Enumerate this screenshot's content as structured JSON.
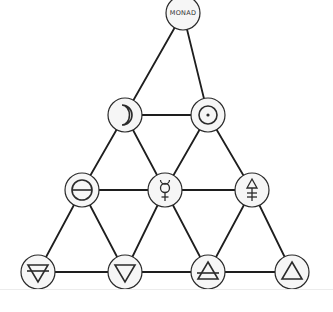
{
  "diagram": {
    "colors": {
      "background": "#ffffff",
      "edge": "#1e1e1e",
      "node_fill": "#f6f6f6",
      "node_stroke": "#2a2a2a",
      "symbol": "#2b2b2b",
      "separator": "#ececec"
    },
    "node_radius": 17,
    "rows": [
      {
        "row": 1,
        "nodes": [
          {
            "id": "monad",
            "label": "MONAD",
            "symbol": "monad-text",
            "x": 183,
            "y": 13
          }
        ]
      },
      {
        "row": 2,
        "nodes": [
          {
            "id": "moon",
            "label": "☽",
            "symbol": "moon-icon",
            "x": 125,
            "y": 115
          },
          {
            "id": "sun",
            "label": "☉",
            "symbol": "sun-icon",
            "x": 208,
            "y": 115
          }
        ]
      },
      {
        "row": 3,
        "nodes": [
          {
            "id": "salt",
            "label": "⊖",
            "symbol": "salt-icon",
            "x": 82,
            "y": 190
          },
          {
            "id": "mercury",
            "label": "☿",
            "symbol": "mercury-icon",
            "x": 165,
            "y": 190
          },
          {
            "id": "sulfur",
            "label": "🜍",
            "symbol": "sulfur-icon",
            "x": 252,
            "y": 190
          }
        ]
      },
      {
        "row": 4,
        "nodes": [
          {
            "id": "earth",
            "label": "🜃",
            "symbol": "earth-icon",
            "x": 38,
            "y": 272
          },
          {
            "id": "water",
            "label": "🜄",
            "symbol": "water-icon",
            "x": 125,
            "y": 272
          },
          {
            "id": "air",
            "label": "🜁",
            "symbol": "air-icon",
            "x": 208,
            "y": 272
          },
          {
            "id": "fire",
            "label": "🜂",
            "symbol": "fire-icon",
            "x": 292,
            "y": 272
          }
        ]
      }
    ],
    "edges": [
      [
        "monad",
        "moon"
      ],
      [
        "monad",
        "sun"
      ],
      [
        "moon",
        "sun"
      ],
      [
        "moon",
        "salt"
      ],
      [
        "moon",
        "mercury"
      ],
      [
        "sun",
        "mercury"
      ],
      [
        "sun",
        "sulfur"
      ],
      [
        "salt",
        "mercury"
      ],
      [
        "mercury",
        "sulfur"
      ],
      [
        "salt",
        "earth"
      ],
      [
        "salt",
        "water"
      ],
      [
        "mercury",
        "water"
      ],
      [
        "mercury",
        "air"
      ],
      [
        "sulfur",
        "air"
      ],
      [
        "sulfur",
        "fire"
      ],
      [
        "earth",
        "water"
      ],
      [
        "water",
        "air"
      ],
      [
        "air",
        "fire"
      ]
    ]
  }
}
